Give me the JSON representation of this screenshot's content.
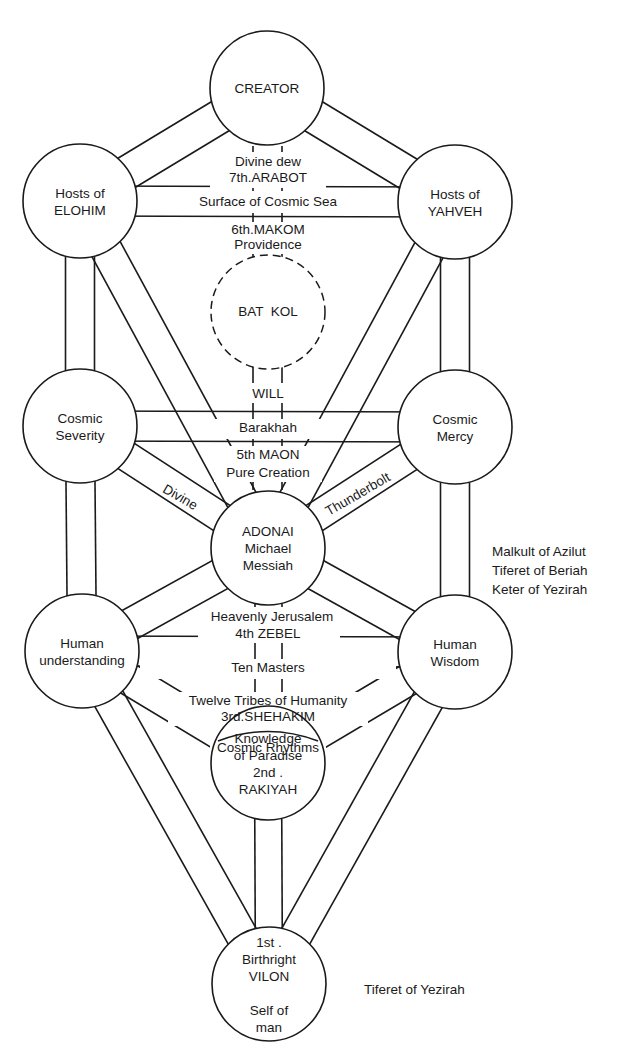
{
  "diagram": {
    "type": "tree-of-life",
    "nodes": [
      {
        "id": "creator",
        "lines": [
          "CREATOR"
        ]
      },
      {
        "id": "elohim",
        "lines": [
          "Hosts of",
          "ELOHIM"
        ]
      },
      {
        "id": "yahveh",
        "lines": [
          "Hosts of",
          "YAHVEH"
        ]
      },
      {
        "id": "severity",
        "lines": [
          "Cosmic",
          "Severity"
        ]
      },
      {
        "id": "mercy",
        "lines": [
          "Cosmic",
          "Mercy"
        ]
      },
      {
        "id": "adonai",
        "lines": [
          "ADONAI",
          "Michael",
          "Messiah"
        ]
      },
      {
        "id": "understanding",
        "lines": [
          "Human",
          "understanding"
        ]
      },
      {
        "id": "wisdom",
        "lines": [
          "Human",
          "Wisdom"
        ]
      },
      {
        "id": "knowledge",
        "lines": [
          "Knowledge",
          "of Paradise",
          "2nd .",
          "RAKIYAH"
        ]
      },
      {
        "id": "self",
        "lines": [
          "1st .",
          "Birthright",
          "VILON",
          "",
          "Self of",
          "man"
        ]
      }
    ],
    "hidden_node": {
      "id": "bat-kol",
      "label": "BAT  KOL",
      "style": "dashed"
    },
    "path_labels": {
      "divine_dew": "Divine dew",
      "arabot": "7th.ARABOT",
      "cosmic_sea": "Surface of Cosmic Sea",
      "makom": "6th.MAKOM",
      "providence": "Providence",
      "will": "WILL",
      "barakhah": "Barakhah",
      "maon": "5th MAON",
      "pure_creation": "Pure Creation",
      "divine": "Divine",
      "thunderbolt": "Thunderbolt",
      "jerusalem": "Heavenly Jerusalem",
      "zebel": "4th ZEBEL",
      "ten_masters": "Ten Masters",
      "twelve_tribes": "Twelve Tribes of Humanity",
      "shehakim": "3rd.SHEHAKIM",
      "cosmic_rhythms": "Cosmic Rhythms"
    },
    "side_notes": {
      "adonai_note": [
        "Malkult of Azilut",
        "Tiferet of Beriah",
        "Keter of Yezirah"
      ],
      "self_note": "Tiferet of Yezirah"
    }
  }
}
